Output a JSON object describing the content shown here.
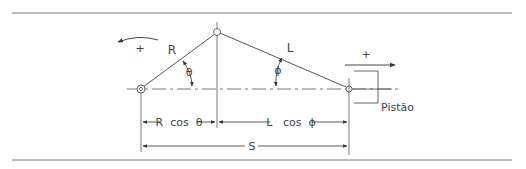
{
  "diagram": {
    "type": "slider-crank mechanism",
    "labels": {
      "crank": "R",
      "rod": "L",
      "theta": "θ",
      "phi": "ϕ",
      "rotation_sign": "+",
      "translation_sign": "+",
      "piston": "Pistão",
      "dim_crank": "R  cos  θ",
      "dim_rod": "L   cos  ϕ",
      "dim_stroke": "S"
    },
    "colors": {
      "line": "#555555",
      "text": "#444444",
      "rule": "#777777"
    }
  }
}
